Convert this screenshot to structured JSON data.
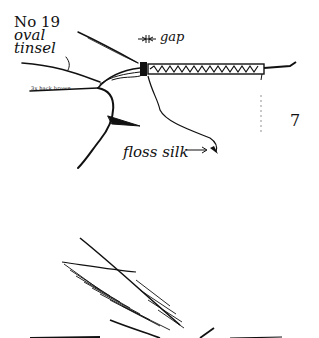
{
  "figure": {
    "number": "7",
    "labels": {
      "tinsel_line1": "No 19",
      "tinsel_line2": "oval",
      "tinsel_line3": "tinsel",
      "gap": "gap",
      "floss": "floss silk",
      "thread": "3x hack brown"
    }
  }
}
